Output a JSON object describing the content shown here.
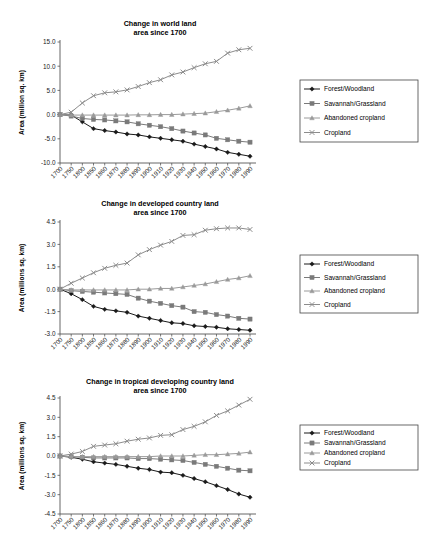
{
  "document": {
    "background_color": "#ffffff",
    "text_color": "#000000",
    "axis_color": "#555555"
  },
  "series_style": {
    "forest": {
      "color": "#1a1a1a",
      "marker": "diamond"
    },
    "savannah": {
      "color": "#7a7a7a",
      "marker": "square"
    },
    "abandoned": {
      "color": "#9a9a9a",
      "marker": "triangle"
    },
    "cropland": {
      "color": "#8c8c8c",
      "marker": "x"
    }
  },
  "legend": {
    "items": [
      {
        "key": "forest",
        "label": "Forest/Woodland"
      },
      {
        "key": "savannah",
        "label": "Savannah/Grassland"
      },
      {
        "key": "abandoned",
        "label": "Abandoned cropland"
      },
      {
        "key": "cropland",
        "label": "Cropland"
      }
    ]
  },
  "charts": [
    {
      "id": "chart-world",
      "chart_data": {
        "type": "line",
        "title": "Change in world land\narea since 1700",
        "title_line1": "Change in world land",
        "title_line2": "area since 1700",
        "xlabel": "",
        "ylabel": "Area (million sq. km)",
        "grid": false,
        "legend_position": "right",
        "categories": [
          "1700",
          "1750",
          "1800",
          "1850",
          "1860",
          "1870",
          "1880",
          "1890",
          "1900",
          "1910",
          "1920",
          "1930",
          "1940",
          "1950",
          "1960",
          "1970",
          "1980",
          "1990"
        ],
        "ylim": [
          -10.0,
          15.0
        ],
        "yticks": [
          "15.0",
          "10.0",
          "5.0",
          "0.0",
          "-5.0",
          "-10.0"
        ],
        "ytick_values": [
          15.0,
          10.0,
          5.0,
          0.0,
          -5.0,
          -10.0
        ],
        "series": [
          {
            "name": "Forest/Woodland",
            "key": "forest",
            "values": [
              0.0,
              -0.1,
              -1.5,
              -2.9,
              -3.3,
              -3.6,
              -4.0,
              -4.2,
              -4.6,
              -4.9,
              -5.2,
              -5.5,
              -6.1,
              -6.6,
              -7.1,
              -7.8,
              -8.2,
              -8.6
            ]
          },
          {
            "name": "Savannah/Grassland",
            "key": "savannah",
            "values": [
              0.0,
              -0.3,
              -0.8,
              -1.0,
              -1.1,
              -1.3,
              -1.5,
              -1.9,
              -2.2,
              -2.5,
              -2.9,
              -3.4,
              -3.8,
              -4.2,
              -4.9,
              -5.2,
              -5.5,
              -5.7
            ]
          },
          {
            "name": "Abandoned cropland",
            "key": "abandoned",
            "values": [
              0.0,
              -0.1,
              -0.1,
              -0.1,
              -0.1,
              -0.1,
              -0.1,
              -0.05,
              -0.05,
              0.0,
              0.0,
              0.1,
              0.2,
              0.3,
              0.6,
              0.9,
              1.3,
              1.8
            ]
          },
          {
            "name": "Cropland",
            "key": "cropland",
            "values": [
              0.0,
              0.5,
              2.4,
              3.9,
              4.5,
              4.7,
              5.1,
              5.8,
              6.6,
              7.2,
              8.2,
              8.8,
              9.7,
              10.5,
              11.0,
              12.7,
              13.4,
              13.7
            ]
          }
        ]
      }
    },
    {
      "id": "chart-developed",
      "chart_data": {
        "type": "line",
        "title": "Change in developed country land\narea since 1700",
        "title_line1": "Change in developed country land",
        "title_line2": "area since 1700",
        "xlabel": "",
        "ylabel": "Area (millions sq. km)",
        "grid": false,
        "legend_position": "right",
        "categories": [
          "1700",
          "1750",
          "1800",
          "1850",
          "1860",
          "1870",
          "1880",
          "1890",
          "1900",
          "1910",
          "1920",
          "1930",
          "1940",
          "1950",
          "1960",
          "1970",
          "1980",
          "1990"
        ],
        "ylim": [
          -3.0,
          4.5
        ],
        "yticks": [
          "4.5",
          "3.0",
          "1.5",
          "0.0",
          "-1.5",
          "-3.0"
        ],
        "ytick_values": [
          4.5,
          3.0,
          1.5,
          0.0,
          -1.5,
          -3.0
        ],
        "series": [
          {
            "name": "Forest/Woodland",
            "key": "forest",
            "values": [
              0.0,
              -0.3,
              -0.7,
              -1.15,
              -1.35,
              -1.45,
              -1.55,
              -1.8,
              -1.95,
              -2.1,
              -2.25,
              -2.3,
              -2.45,
              -2.5,
              -2.55,
              -2.65,
              -2.7,
              -2.75
            ]
          },
          {
            "name": "Savannah/Grassland",
            "key": "savannah",
            "values": [
              0.0,
              -0.1,
              -0.15,
              -0.2,
              -0.25,
              -0.3,
              -0.35,
              -0.6,
              -0.8,
              -0.95,
              -1.1,
              -1.2,
              -1.5,
              -1.55,
              -1.7,
              -1.8,
              -1.95,
              -2.0
            ]
          },
          {
            "name": "Abandoned cropland",
            "key": "abandoned",
            "values": [
              0.0,
              -0.05,
              -0.05,
              -0.05,
              -0.05,
              -0.05,
              -0.05,
              0.0,
              0.0,
              0.05,
              0.05,
              0.15,
              0.25,
              0.35,
              0.5,
              0.65,
              0.75,
              0.9
            ]
          },
          {
            "name": "Cropland",
            "key": "cropland",
            "values": [
              0.0,
              0.4,
              0.75,
              1.1,
              1.4,
              1.6,
              1.75,
              2.3,
              2.65,
              2.95,
              3.2,
              3.6,
              3.65,
              3.95,
              4.05,
              4.1,
              4.1,
              4.0
            ]
          }
        ]
      }
    },
    {
      "id": "chart-tropical",
      "chart_data": {
        "type": "line",
        "title": "Change in tropical developing country land\narea since 1700",
        "title_line1": "Change in tropical developing country land",
        "title_line2": "area since 1700",
        "xlabel": "",
        "ylabel": "Area (millions sq. km)",
        "grid": false,
        "legend_position": "right",
        "categories": [
          "1700",
          "1750",
          "1800",
          "1850",
          "1860",
          "1870",
          "1880",
          "1890",
          "1900",
          "1910",
          "1920",
          "1930",
          "1940",
          "1950",
          "1960",
          "1970",
          "1980",
          "1990"
        ],
        "ylim": [
          -4.5,
          4.5
        ],
        "yticks": [
          "4.5",
          "3.0",
          "1.5",
          "0.0",
          "-1.5",
          "-3.0",
          "-4.5"
        ],
        "ytick_values": [
          4.5,
          3.0,
          1.5,
          0.0,
          -1.5,
          -3.0,
          -4.5
        ],
        "series": [
          {
            "name": "Forest/Woodland",
            "key": "forest",
            "values": [
              0.0,
              -0.1,
              -0.25,
              -0.45,
              -0.55,
              -0.65,
              -0.8,
              -0.95,
              -1.05,
              -1.25,
              -1.3,
              -1.5,
              -1.75,
              -2.0,
              -2.3,
              -2.6,
              -2.95,
              -3.2
            ]
          },
          {
            "name": "Savannah/Grassland",
            "key": "savannah",
            "values": [
              0.0,
              -0.05,
              -0.1,
              -0.15,
              -0.15,
              -0.15,
              -0.15,
              -0.2,
              -0.2,
              -0.25,
              -0.3,
              -0.35,
              -0.5,
              -0.65,
              -0.8,
              -0.95,
              -1.1,
              -1.15
            ]
          },
          {
            "name": "Abandoned cropland",
            "key": "abandoned",
            "values": [
              0.0,
              -0.05,
              -0.05,
              -0.05,
              -0.05,
              -0.05,
              -0.05,
              -0.05,
              -0.05,
              0.0,
              0.0,
              0.0,
              0.05,
              0.1,
              0.1,
              0.15,
              0.2,
              0.3
            ]
          },
          {
            "name": "Cropland",
            "key": "cropland",
            "values": [
              0.0,
              0.15,
              0.35,
              0.75,
              0.85,
              0.95,
              1.15,
              1.3,
              1.4,
              1.6,
              1.65,
              2.05,
              2.3,
              2.65,
              3.15,
              3.5,
              3.95,
              4.4
            ]
          }
        ]
      }
    }
  ]
}
